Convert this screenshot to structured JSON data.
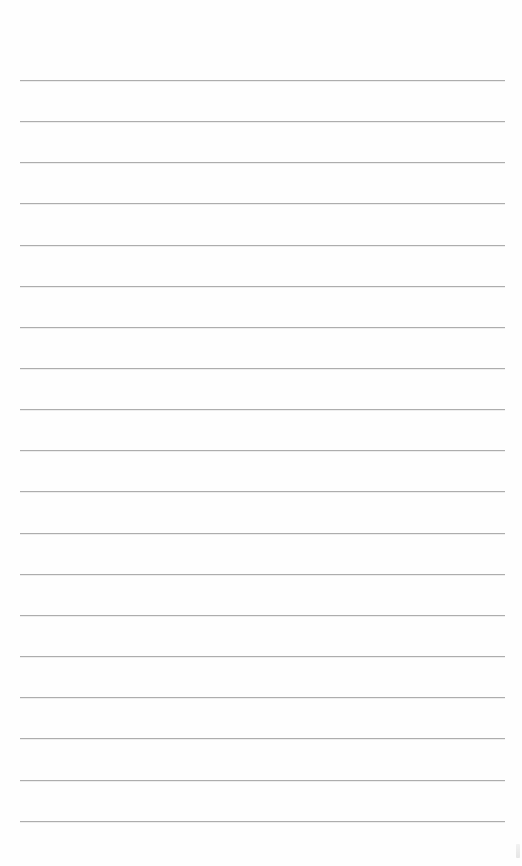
{
  "page": {
    "type": "lined-paper",
    "background_color": "#fefefe",
    "rule_color": "#adadad",
    "rule_left": 20,
    "rule_width": 485,
    "rules_y": [
      80,
      121,
      162,
      203,
      245,
      286,
      327,
      368,
      409,
      450,
      491,
      533,
      574,
      615,
      656,
      697,
      738,
      780,
      821
    ]
  }
}
